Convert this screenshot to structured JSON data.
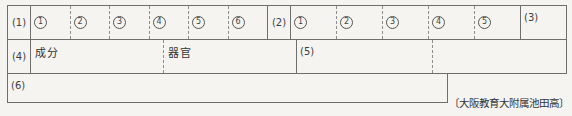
{
  "meta": {
    "background_color": "#f5f4f1",
    "line_color": "#6e6e6e",
    "dashed_line_color": "#8d8d8d",
    "text_color": "#3a3a3a"
  },
  "sheet": {
    "row1": {
      "q1_label": "(1)",
      "q1_items": [
        "1",
        "2",
        "3",
        "4",
        "5",
        "6"
      ],
      "q2_label": "(2)",
      "q2_items": [
        "1",
        "2",
        "3",
        "4",
        "5"
      ],
      "q3_label": "(3)"
    },
    "row2": {
      "q4_label": "(4)",
      "headers": [
        "成分",
        "器官"
      ],
      "q5_label": "(5)"
    },
    "row3": {
      "q6_label": "(6)"
    }
  },
  "footer": {
    "citation": "〔大阪教育大附属池田高〕"
  }
}
